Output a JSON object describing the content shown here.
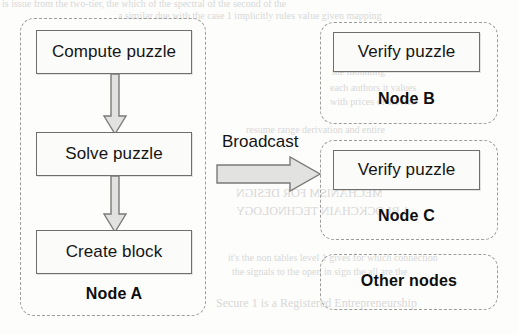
{
  "diagram": {
    "colors": {
      "box_fill": "#fbfbfa",
      "box_border": "#6e6e6c",
      "container_border": "#9c9c9a",
      "arrow_fill": "#e2e2e0",
      "arrow_border": "#7a7a78",
      "text": "#151515",
      "background": "#fdfdfc",
      "ghost_text": "#d8d8d6"
    },
    "mining_node": {
      "label": "Node A",
      "steps": [
        {
          "label": "Compute puzzle",
          "name": "compute-puzzle-box"
        },
        {
          "label": "Solve puzzle",
          "name": "solve-puzzle-box"
        },
        {
          "label": "Create block",
          "name": "create-block-box"
        }
      ]
    },
    "broadcast": {
      "label": "Broadcast",
      "direction": "right"
    },
    "verifier_nodes": [
      {
        "label": "Node B",
        "step": "Verify puzzle"
      },
      {
        "label": "Node C",
        "step": "Verify puzzle"
      }
    ],
    "other_nodes": {
      "label": "Other nodes"
    },
    "background_artifacts": [
      {
        "text": "is issue from the two-tier, the which of the spectral of the second of the",
        "x": 2,
        "y": -2,
        "size": 10,
        "mirrored": false
      },
      {
        "text": "a similar  due with the case 1 implicitly  rules  value  given  mapping",
        "x": 118,
        "y": 10,
        "size": 10,
        "mirrored": false
      },
      {
        "text": "thin",
        "x": 338,
        "y": 52,
        "size": 10,
        "mirrored": false
      },
      {
        "text": "the mounting",
        "x": 332,
        "y": 66,
        "size": 10,
        "mirrored": false
      },
      {
        "text": "each  authors  it  values",
        "x": 330,
        "y": 82,
        "size": 10,
        "mirrored": false
      },
      {
        "text": "with prices of service",
        "x": 330,
        "y": 96,
        "size": 10,
        "mirrored": false
      },
      {
        "text": "resume range  derivation  and  entire",
        "x": 246,
        "y": 124,
        "size": 10,
        "mirrored": false
      },
      {
        "text": "MECHANISM FOR DESIGN",
        "x": 236,
        "y": 186,
        "size": 12,
        "mirrored": true
      },
      {
        "text": "A BLOCKCHAIN TECHNOLOGY",
        "x": 236,
        "y": 204,
        "size": 12,
        "mirrored": true
      },
      {
        "text": "it's  the non  tables  level  1  gives  for  which  connection",
        "x": 228,
        "y": 252,
        "size": 10,
        "mirrored": false
      },
      {
        "text": "the  signals  to  the  open  in  sign  the  all  are  the",
        "x": 232,
        "y": 266,
        "size": 10,
        "mirrored": false
      },
      {
        "text": "Secure 1 is a Registered Entrepreneurship",
        "x": 216,
        "y": 296,
        "size": 12,
        "mirrored": false
      }
    ]
  }
}
